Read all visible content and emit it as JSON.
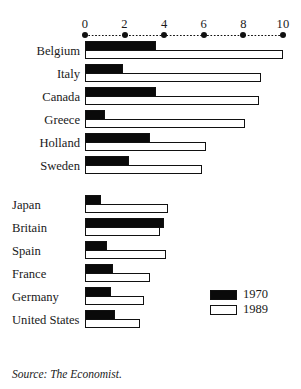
{
  "chart_data": {
    "type": "bar",
    "orientation": "horizontal",
    "title": "",
    "xlabel": "",
    "ylabel": "",
    "xlim": [
      0,
      10
    ],
    "grid": false,
    "axis_ticks": [
      0,
      2,
      4,
      6,
      8,
      10
    ],
    "tick_labels": [
      "0",
      "2",
      "4",
      "6",
      "8",
      "10"
    ],
    "legend_position": "right-lower",
    "categories": [
      "Belgium",
      "Italy",
      "Canada",
      "Greece",
      "Holland",
      "Sweden",
      "Japan",
      "Britain",
      "Spain",
      "France",
      "Germany",
      "United States"
    ],
    "group_break_after": "Sweden",
    "series": [
      {
        "name": "1970",
        "color": "#0a0a0a",
        "values": [
          3.6,
          1.9,
          3.6,
          1.0,
          3.3,
          2.2,
          0.8,
          4.0,
          1.1,
          1.4,
          1.3,
          1.5
        ]
      },
      {
        "name": "1989",
        "color": "#ffffff",
        "values": [
          10.0,
          8.9,
          8.8,
          8.1,
          6.1,
          5.9,
          4.2,
          3.8,
          4.1,
          3.3,
          3.0,
          2.8
        ]
      }
    ]
  },
  "legend": {
    "items": [
      {
        "label": "1970",
        "swatch": "black"
      },
      {
        "label": "1989",
        "swatch": "white"
      }
    ]
  },
  "source": {
    "text": "Source: The Economist."
  }
}
